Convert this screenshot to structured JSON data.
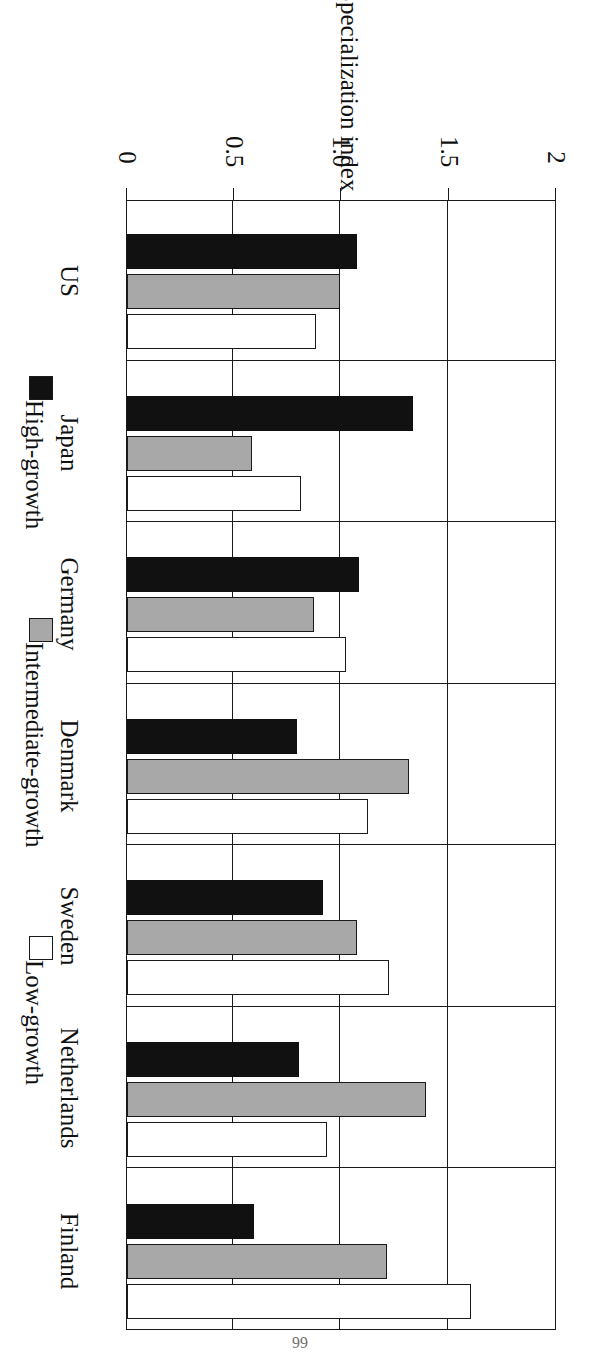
{
  "chart_data": {
    "type": "bar",
    "orientation": "horizontal",
    "title": "",
    "xlabel": "",
    "ylabel": "Specialization index",
    "axis_title": "Specialization index",
    "categories": [
      "US",
      "Japan",
      "Germany",
      "Denmark",
      "Sweden",
      "Netherlands",
      "Finland"
    ],
    "tick_labels": [
      "0",
      "0.5",
      "1.0",
      "1.5",
      "2"
    ],
    "tick_values": [
      0,
      0.5,
      1.0,
      1.5,
      2
    ],
    "ylim": [
      0,
      2
    ],
    "grid": true,
    "legend_position": "bottom",
    "series": [
      {
        "name": "High-growth",
        "color": "#111111",
        "values": [
          1.07,
          1.33,
          1.08,
          0.79,
          0.91,
          0.8,
          0.59
        ]
      },
      {
        "name": "Intermediate-growth",
        "color": "#a8a8a8",
        "values": [
          0.99,
          0.58,
          0.87,
          1.31,
          1.07,
          1.39,
          1.21
        ]
      },
      {
        "name": "Low-growth",
        "color": "#ffffff",
        "values": [
          0.88,
          0.81,
          1.02,
          1.12,
          1.22,
          0.93,
          1.6
        ]
      }
    ]
  },
  "legend": {
    "items": [
      {
        "label": "High-growth",
        "swatch": "black-square-icon"
      },
      {
        "label": "Intermediate-growth",
        "swatch": "gray-square-icon"
      },
      {
        "label": "Low-growth",
        "swatch": "white-square-icon"
      }
    ]
  },
  "axis": {
    "title": "Specialization index",
    "ticks": [
      "2",
      "1.5",
      "1.0",
      "0.5",
      "0"
    ]
  },
  "page": {
    "folio": "66"
  }
}
